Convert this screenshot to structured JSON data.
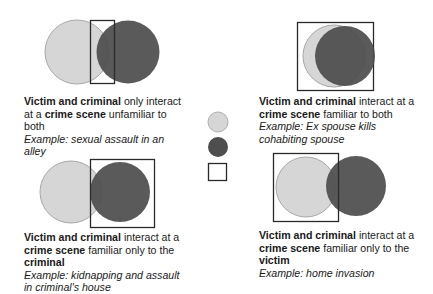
{
  "colors": {
    "victim_fill": "#d6d6d6",
    "victim_stroke": "#a8a8a8",
    "criminal_fill": "#4e4e4e",
    "box_stroke": "#2a2a2a"
  },
  "legend": {
    "items": [
      {
        "shape": "light-circle",
        "meaning": "victim"
      },
      {
        "shape": "dark-circle",
        "meaning": "criminal"
      },
      {
        "shape": "square",
        "meaning": "crime scene"
      }
    ]
  },
  "panels": [
    {
      "id": "top-left",
      "bold1": "Victim and criminal",
      "text1": " only interact at a ",
      "bold2": "crime scene",
      "text2": " unfamiliar to both",
      "bold3": "",
      "example": "Example: sexual assault in an alley"
    },
    {
      "id": "top-right",
      "bold1": "Victim and criminal",
      "text1": " interact at a ",
      "bold2": "crime scene",
      "text2": " familiar to both",
      "bold3": "",
      "example": "Example: Ex spouse kills cohabiting spouse"
    },
    {
      "id": "bottom-left",
      "bold1": "Victim and criminal",
      "text1": " interact at a ",
      "bold2": "crime scene",
      "text2": " familiar only to the ",
      "bold3": "criminal",
      "example": "Example: kidnapping and assault in criminal's house"
    },
    {
      "id": "bottom-right",
      "bold1": "Victim and criminal",
      "text1": " interact at a ",
      "bold2": "crime scene",
      "text2": " familiar only to the ",
      "bold3": "victim",
      "example": "Example: home invasion"
    }
  ]
}
